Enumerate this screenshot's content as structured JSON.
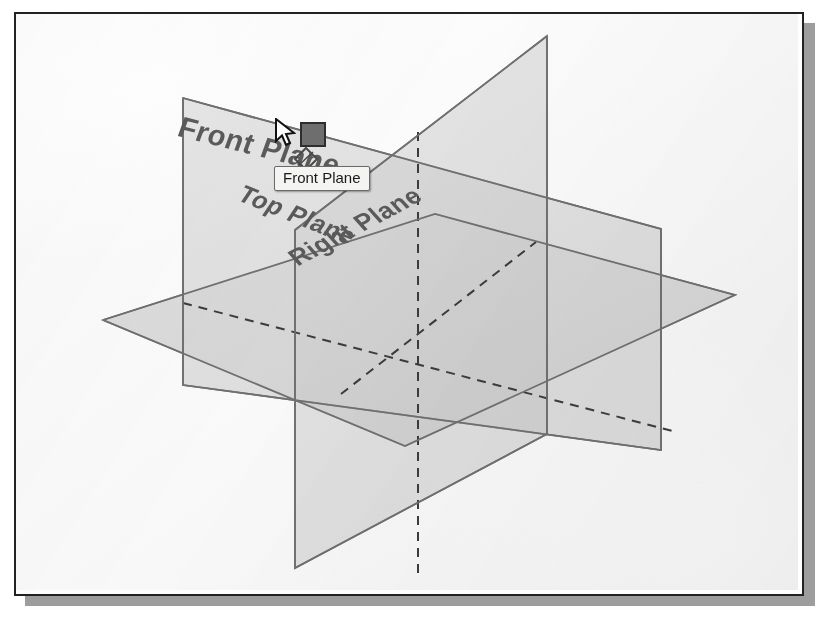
{
  "application": {
    "name": "SolidWorks 3D Viewport",
    "view_type": "isometric"
  },
  "viewport": {
    "background_color": "#ffffff",
    "frame_border_color": "#222222",
    "shadow_color": "#9d9d9d"
  },
  "planes": [
    {
      "id": "front-plane",
      "label": "Front Plane",
      "orientation": "vertical-frontal",
      "state": "selected",
      "fill_color": "#d4d4d4",
      "edge_color": "#6d6d6d"
    },
    {
      "id": "top-plane",
      "label": "Top Plane",
      "orientation": "horizontal",
      "state": "visible",
      "fill_color": "#d0d0d0",
      "edge_color": "#6d6d6d"
    },
    {
      "id": "right-plane",
      "label": "Right Plane",
      "orientation": "vertical-sagittal",
      "state": "visible",
      "fill_color": "#cccccc",
      "edge_color": "#6d6d6d"
    }
  ],
  "tooltip": {
    "text": "Front Plane",
    "visible": true,
    "background_color": "#f4f4f2",
    "border_color": "#6b6b6b",
    "text_color": "#1a1a1a"
  },
  "cursor": {
    "type": "arrow-pointer",
    "icon": "mouse-arrow-icon",
    "x": 265,
    "y": 112
  },
  "selection_handle": {
    "icon": "selection-square-handle",
    "fill_color": "#6e6e6e",
    "border_color": "#2e2e2e",
    "x": 295,
    "y": 118
  },
  "plane_glyph": {
    "icon": "plane-diamond-icon",
    "stroke_color": "#4a4a4a",
    "x": 290,
    "y": 145
  },
  "hidden_lines": {
    "style": "dashed",
    "color": "#3a3a3a",
    "description": "Hidden intersection edges of the three reference planes"
  },
  "origin": {
    "x": 418,
    "y": 308,
    "label": ""
  }
}
